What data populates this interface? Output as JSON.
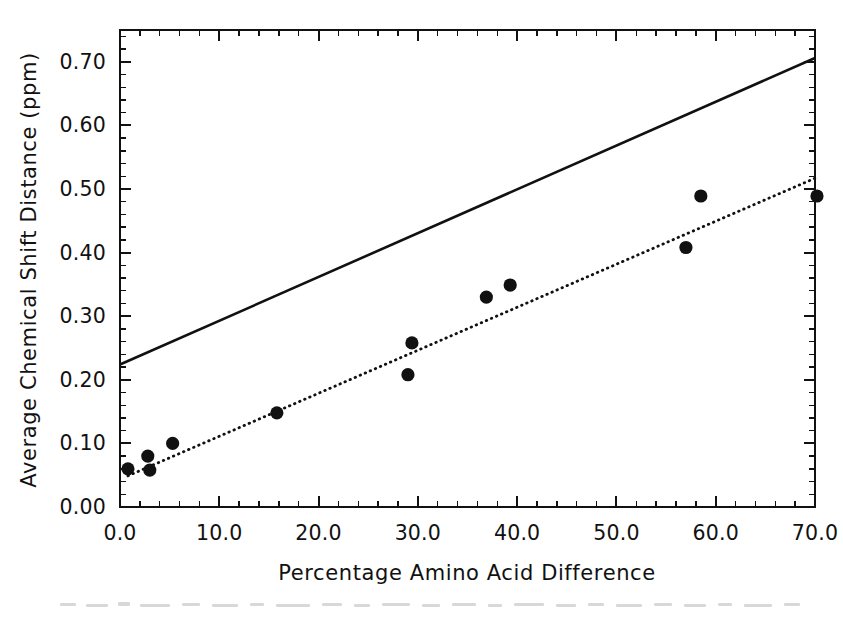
{
  "chart_data": {
    "type": "scatter",
    "title": "",
    "xlabel": "Percentage Amino Acid Difference",
    "ylabel": "Average Chemical Shift Distance (ppm)",
    "xlim": [
      0.0,
      70.0
    ],
    "ylim": [
      0.0,
      0.75
    ],
    "grid": false,
    "legend_position": "none",
    "xticks": [
      0.0,
      10.0,
      20.0,
      30.0,
      40.0,
      50.0,
      60.0,
      70.0
    ],
    "xticklabels": [
      "0.0",
      "10.0",
      "20.0",
      "30.0",
      "40.0",
      "50.0",
      "60.0",
      "70.0"
    ],
    "xtick_minor_step": 2.0,
    "yticks": [
      0.0,
      0.1,
      0.2,
      0.3,
      0.4,
      0.5,
      0.6,
      0.7
    ],
    "yticklabels": [
      "0.00",
      "0.10",
      "0.20",
      "0.30",
      "0.40",
      "0.50",
      "0.60",
      "0.70"
    ],
    "ytick_minor_step": 0.02,
    "ticks_all_sides": true,
    "tick_direction": "in",
    "series": [
      {
        "name": "data-points",
        "marker": "filled-circle",
        "marker_color": "#111111",
        "points": [
          {
            "x": 0.8,
            "y": 0.06
          },
          {
            "x": 2.8,
            "y": 0.08
          },
          {
            "x": 3.0,
            "y": 0.058
          },
          {
            "x": 5.3,
            "y": 0.1
          },
          {
            "x": 15.8,
            "y": 0.148
          },
          {
            "x": 29.0,
            "y": 0.208
          },
          {
            "x": 29.4,
            "y": 0.258
          },
          {
            "x": 36.9,
            "y": 0.33
          },
          {
            "x": 39.3,
            "y": 0.349
          },
          {
            "x": 57.0,
            "y": 0.408
          },
          {
            "x": 58.5,
            "y": 0.489
          },
          {
            "x": 70.2,
            "y": 0.489
          }
        ]
      }
    ],
    "lines": [
      {
        "name": "upper-solid-line",
        "style": "solid",
        "color": "#111111",
        "x0": 0.0,
        "y0": 0.224,
        "x1": 70.0,
        "y1": 0.706
      },
      {
        "name": "regression-dotted-line",
        "style": "dotted",
        "color": "#111111",
        "x0": 0.8,
        "y0": 0.049,
        "x1": 70.0,
        "y1": 0.517
      }
    ]
  },
  "axes": {
    "x_title": "Percentage Amino Acid Difference",
    "y_title": "Average Chemical Shift Distance (ppm)"
  }
}
